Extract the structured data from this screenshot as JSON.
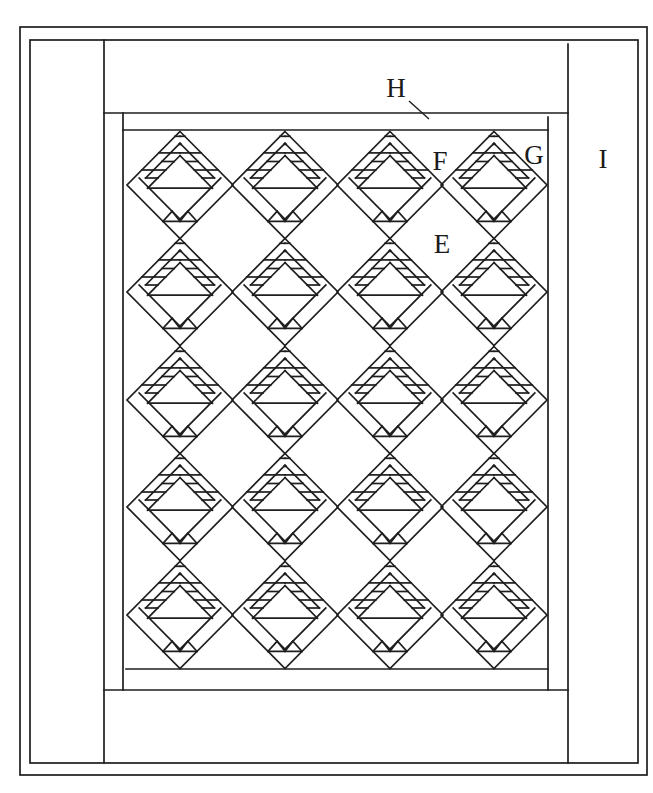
{
  "diagram": {
    "type": "quilt-layout",
    "stroke_color": "#1e1e1e",
    "background": "#ffffff",
    "borders": {
      "outer_binding": {
        "x1": 20,
        "y1": 27,
        "x2": 647,
        "y2": 775
      },
      "inner_binding": {
        "x1": 30,
        "y1": 40,
        "x2": 638,
        "y2": 763
      },
      "top_border_H": {
        "x1": 104,
        "y1": 113,
        "x2": 568
      },
      "side_border_I_x": 568,
      "left_side_border_x": 104,
      "bottom_border_y": 690,
      "inner_strip_G": {
        "x1": 123,
        "y1": 117,
        "x2": 548,
        "y2": 690
      },
      "quilt_center": {
        "x1": 126,
        "y1": 130,
        "x2": 548,
        "y2": 669
      }
    },
    "grid": {
      "columns": 4,
      "rows": 5,
      "col_centers": [
        180,
        285,
        390,
        494
      ],
      "row_centers": [
        185,
        292,
        400,
        507,
        615
      ],
      "half_width": 53,
      "half_height": 53.5,
      "block_name": "basket-block"
    },
    "labels": [
      {
        "id": "H",
        "text": "H",
        "x": 396,
        "y": 97,
        "leader": {
          "x1": 409,
          "y1": 101,
          "x2": 429,
          "y2": 119
        }
      },
      {
        "id": "F",
        "text": "F",
        "x": 440,
        "y": 170
      },
      {
        "id": "G",
        "text": "G",
        "x": 534,
        "y": 164
      },
      {
        "id": "I",
        "text": "I",
        "x": 603,
        "y": 168
      },
      {
        "id": "E",
        "text": "E",
        "x": 442,
        "y": 253
      }
    ]
  }
}
